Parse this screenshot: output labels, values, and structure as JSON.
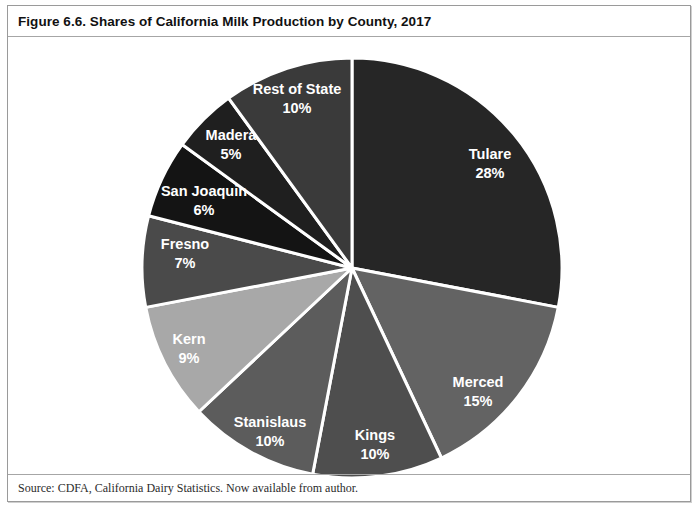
{
  "figure": {
    "title": "Figure 6.6. Shares of California Milk Production by County, 2017",
    "source": "Source: CDFA, California Dairy Statistics. Now available from author."
  },
  "chart_data": {
    "type": "pie",
    "title": "Figure 6.6. Shares of California Milk Production by County, 2017",
    "xlabel": "",
    "ylabel": "",
    "unit": "percent",
    "start_angle_deg": 0,
    "direction": "clockwise",
    "legend": "none",
    "labels_inside": true,
    "center": {
      "x": 352,
      "y": 268
    },
    "radius": 210,
    "slices": [
      {
        "label": "Tulare",
        "value": 28,
        "value_text": "28%",
        "color": "#262626",
        "label_x": 490,
        "label_y": 155,
        "value_x": 490,
        "value_y": 174
      },
      {
        "label": "Merced",
        "value": 15,
        "value_text": "15%",
        "color": "#636363",
        "label_x": 478,
        "label_y": 383,
        "value_x": 478,
        "value_y": 402
      },
      {
        "label": "Kings",
        "value": 10,
        "value_text": "10%",
        "color": "#4e4e4e",
        "label_x": 375,
        "label_y": 436,
        "value_x": 375,
        "value_y": 455
      },
      {
        "label": "Stanislaus",
        "value": 10,
        "value_text": "10%",
        "color": "#5c5c5c",
        "label_x": 270,
        "label_y": 423,
        "value_x": 270,
        "value_y": 442
      },
      {
        "label": "Kern",
        "value": 9,
        "value_text": "9%",
        "color": "#a8a8a8",
        "label_x": 189,
        "label_y": 340,
        "value_x": 189,
        "value_y": 359
      },
      {
        "label": "Fresno",
        "value": 7,
        "value_text": "7%",
        "color": "#4a4a4a",
        "label_x": 185,
        "label_y": 245,
        "value_x": 185,
        "value_y": 264
      },
      {
        "label": "San Joaquin",
        "value": 6,
        "value_text": "6%",
        "color": "#141414",
        "label_x": 204,
        "label_y": 192,
        "value_x": 204,
        "value_y": 211
      },
      {
        "label": "Madera",
        "value": 5,
        "value_text": "5%",
        "color": "#1f1f1f",
        "label_x": 231,
        "label_y": 136,
        "value_x": 231,
        "value_y": 155
      },
      {
        "label": "Rest of State",
        "value": 10,
        "value_text": "10%",
        "color": "#3a3a3a",
        "label_x": 297,
        "label_y": 90,
        "value_x": 297,
        "value_y": 109
      }
    ],
    "slice_divider_color": "#ffffff",
    "background": "#ffffff"
  }
}
